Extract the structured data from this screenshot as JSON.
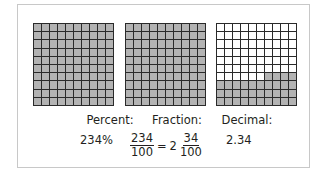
{
  "grids": [
    {
      "name": "grid-percent",
      "shaded": 100,
      "partial_row_cells": 0
    },
    {
      "name": "grid-fraction",
      "shaded": 100,
      "partial_row_cells": 0
    },
    {
      "name": "grid-decimal",
      "shaded": 34,
      "full_rows_from_bottom": 3,
      "partial_row_cells_right": 4
    }
  ],
  "labels": {
    "percent": "Percent:",
    "fraction": "Fraction:",
    "decimal": "Decimal:"
  },
  "values": {
    "percent": "234%",
    "fraction_improper_num": "234",
    "fraction_improper_den": "100",
    "equals": "=",
    "mixed_whole": "2",
    "mixed_num": "34",
    "mixed_den": "100",
    "decimal": "2.34"
  },
  "colors": {
    "shaded": "#b3b3b3",
    "gridline": "#2a2a2a",
    "frame": "#c8c8c8"
  }
}
